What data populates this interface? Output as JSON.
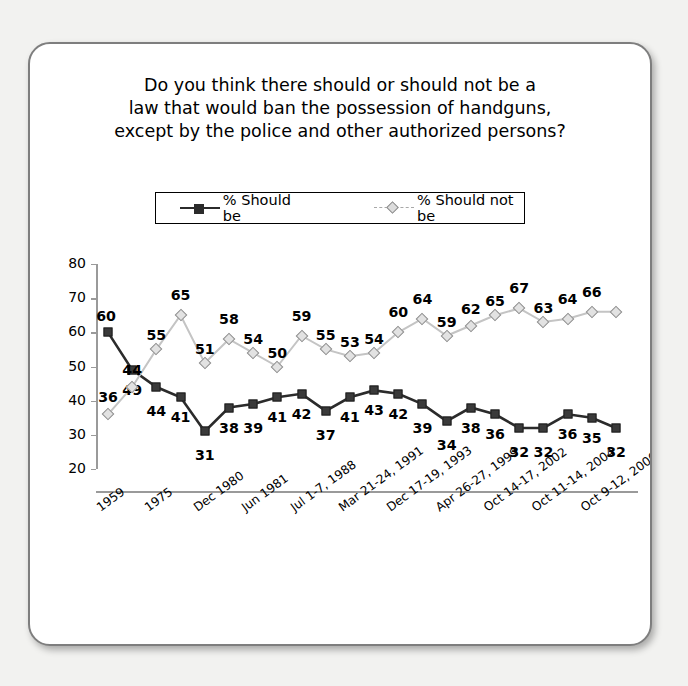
{
  "title": {
    "line1": "Do you think there should or should not be a",
    "line2": "law that would ban the possession of handguns,",
    "line3": "except by the police and other authorized persons?"
  },
  "legend": {
    "series1": "% Should be",
    "series2": "% Should not be"
  },
  "colors": {
    "series1": "#2b2b2b",
    "series2": "#b8b8b8",
    "axis": "#9a9a9a",
    "card_border": "#7e7e7e",
    "page_background": "#f2f2f0"
  },
  "chart_data": {
    "type": "line",
    "title": "Do you think there should or should not be a law that would ban the possession of handguns, except by the police and other authorized persons?",
    "xlabel": "",
    "ylabel": "",
    "ylim": [
      20,
      80
    ],
    "yticks": [
      20,
      30,
      40,
      50,
      60,
      70,
      80
    ],
    "grid": false,
    "legend_position": "top",
    "categories": [
      "1959",
      "",
      "1975",
      "",
      "Dec 1980",
      "",
      "Jun 1981",
      "",
      "Jul 1-7, 1988",
      "",
      "Mar 21-24, 1991",
      "",
      "Dec 17-19, 1993",
      "",
      "Apr 26-27, 1999",
      "",
      "Oct 14-17, 2002",
      "",
      "Oct 11-14, 2004",
      "",
      "Oct 9-12, 2006",
      ""
    ],
    "tick_labels": [
      "1959",
      "1975",
      "Dec 1980",
      "Jun 1981",
      "Jul 1-7, 1988",
      "Mar 21-24, 1991",
      "Dec 17-19, 1993",
      "Apr 26-27, 1999",
      "Oct 14-17, 2002",
      "Oct 11-14, 2004",
      "Oct 9-12, 2006"
    ],
    "series": [
      {
        "name": "% Should be",
        "marker": "square",
        "color": "#2b2b2b",
        "values": [
          60,
          49,
          44,
          41,
          31,
          38,
          39,
          41,
          42,
          37,
          41,
          43,
          42,
          39,
          34,
          38,
          36,
          32,
          32,
          36,
          35,
          32
        ]
      },
      {
        "name": "% Should not be",
        "marker": "diamond",
        "color": "#b8b8b8",
        "values": [
          36,
          44,
          55,
          65,
          51,
          58,
          54,
          50,
          59,
          55,
          53,
          54,
          60,
          64,
          59,
          62,
          65,
          67,
          63,
          64,
          66,
          66
        ]
      }
    ]
  }
}
